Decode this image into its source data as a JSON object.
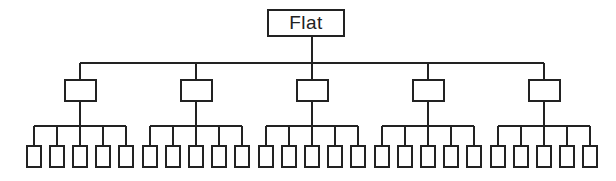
{
  "diagram": {
    "title": "Flat",
    "type": "org-hierarchy",
    "root": {
      "label": "Flat"
    },
    "levels": 3,
    "mid_nodes": [
      {
        "label": "",
        "children": 5
      },
      {
        "label": "",
        "children": 5
      },
      {
        "label": "",
        "children": 5
      },
      {
        "label": "",
        "children": 5
      },
      {
        "label": "",
        "children": 5
      }
    ],
    "leaf_count": 25,
    "colors": {
      "stroke": "#222222",
      "background": "#ffffff"
    }
  }
}
